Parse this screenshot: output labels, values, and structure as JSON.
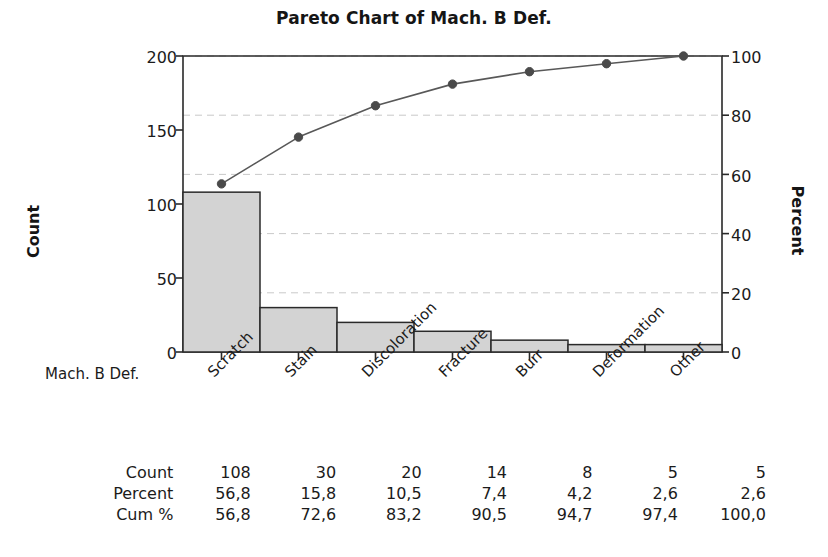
{
  "title": "Pareto Chart of Mach. B Def.",
  "axes": {
    "left_title": "Count",
    "right_title": "Percent",
    "x_axis_name": "Mach. B Def.",
    "left_ticks": [
      "0",
      "50",
      "100",
      "150",
      "200"
    ],
    "right_ticks": [
      "0",
      "20",
      "40",
      "60",
      "80",
      "100"
    ]
  },
  "table": {
    "row_labels": [
      "Count",
      "Percent",
      "Cum %"
    ],
    "count": [
      "108",
      "30",
      "20",
      "14",
      "8",
      "5",
      "5"
    ],
    "percent": [
      "56,8",
      "15,8",
      "10,5",
      "7,4",
      "4,2",
      "2,6",
      "2,6"
    ],
    "cum": [
      "56,8",
      "72,6",
      "83,2",
      "90,5",
      "94,7",
      "97,4",
      "100,0"
    ]
  },
  "colors": {
    "bar_fill": "#d3d3d3",
    "bar_stroke": "#2a2a2a",
    "line": "#585858",
    "marker": "#4a4a4a",
    "gridline": "#c9c9c9",
    "axis": "#2a2a2a",
    "text": "#1b1b1b"
  },
  "chart_data": {
    "type": "bar",
    "title": "Pareto Chart of Mach. B Def.",
    "xlabel": "Mach. B Def.",
    "ylabel": "Count",
    "y2label": "Percent",
    "categories": [
      "Scratch",
      "Stain",
      "Discoloration",
      "Fracture",
      "Burr",
      "Deformation",
      "Other"
    ],
    "values": [
      108,
      30,
      20,
      14,
      8,
      5,
      5
    ],
    "percent": [
      56.8,
      15.8,
      10.5,
      7.4,
      4.2,
      2.6,
      2.6
    ],
    "cumulative_percent": [
      56.8,
      72.6,
      83.2,
      90.5,
      94.7,
      97.4,
      100.0
    ],
    "ylim": [
      0,
      200
    ],
    "y2lim": [
      0,
      100
    ],
    "yticks": [
      0,
      50,
      100,
      150,
      200
    ],
    "y2ticks": [
      0,
      20,
      40,
      60,
      80,
      100
    ],
    "grid": true,
    "legend": "none",
    "series": [
      {
        "name": "Count",
        "type": "bar",
        "values": [
          108,
          30,
          20,
          14,
          8,
          5,
          5
        ]
      },
      {
        "name": "Cum %",
        "type": "line",
        "values": [
          56.8,
          72.6,
          83.2,
          90.5,
          94.7,
          97.4,
          100.0
        ]
      }
    ]
  }
}
